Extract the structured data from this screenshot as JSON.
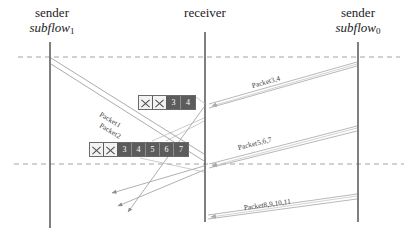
{
  "diagram": {
    "background": "#ffffff",
    "timelines": [
      {
        "id": "left",
        "x": 50,
        "top": 42,
        "bottom": 228,
        "role": "sender",
        "label_line1": "sender",
        "label_line2": "subflow",
        "subscript": "1"
      },
      {
        "id": "mid",
        "x": 205,
        "top": 32,
        "bottom": 222,
        "role": "receiver",
        "label_line1": "receiver",
        "label_line2": "",
        "subscript": ""
      },
      {
        "id": "right",
        "x": 358,
        "top": 42,
        "bottom": 222,
        "role": "sender",
        "label_line1": "sender",
        "label_line2": "subflow",
        "subscript": "0"
      }
    ],
    "dashed_lines": [
      {
        "y": 57,
        "color": "#9a9a9a"
      },
      {
        "y": 164,
        "color": "#9a9a9a"
      }
    ],
    "packet_labels": [
      {
        "id": "p1",
        "text": "Packet1",
        "x": 100,
        "y": 110,
        "rotate": 31
      },
      {
        "id": "p2",
        "text": "Packet2",
        "x": 100,
        "y": 121,
        "rotate": 31
      },
      {
        "id": "p34",
        "text": "Packet3,4",
        "x": 266,
        "y": 84,
        "rotate": -12
      },
      {
        "id": "p567",
        "text": "Packet5,6,7",
        "x": 252,
        "y": 146,
        "rotate": -13
      },
      {
        "id": "p891011",
        "text": "Packet8,9,10,11",
        "x": 256,
        "y": 206,
        "rotate": -11
      }
    ],
    "blocks": [
      {
        "id": "block-a",
        "x": 138,
        "y": 95,
        "cells": [
          {
            "value": "",
            "crossed": true
          },
          {
            "value": "",
            "crossed": true
          },
          {
            "value": "3",
            "crossed": false
          },
          {
            "value": "4",
            "crossed": false
          }
        ]
      },
      {
        "id": "block-b",
        "x": 89,
        "y": 142,
        "cells": [
          {
            "value": "",
            "crossed": true
          },
          {
            "value": "",
            "crossed": true
          },
          {
            "value": "3",
            "crossed": false
          },
          {
            "value": "4",
            "crossed": false
          },
          {
            "value": "5",
            "crossed": false
          },
          {
            "value": "6",
            "crossed": false
          },
          {
            "value": "7",
            "crossed": false
          }
        ]
      }
    ],
    "colors": {
      "timeline": "#555555",
      "dashed": "#9a9a9a",
      "arrow_thin": "#9c9c9c",
      "arrow_band": "#b4b4b4",
      "block_fill": "#5c5c5c",
      "block_crossed_fill": "#f2f2f2",
      "text": "#1a1a1a"
    }
  }
}
